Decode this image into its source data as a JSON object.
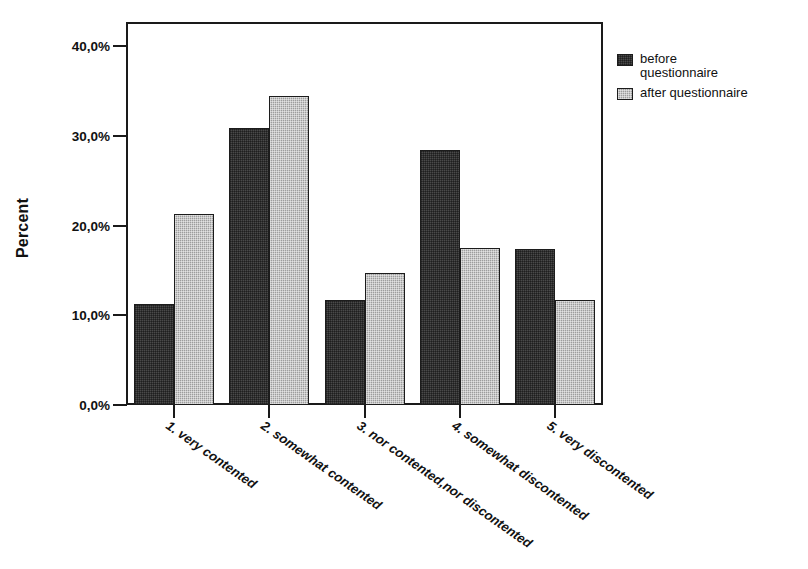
{
  "chart_data": {
    "type": "bar",
    "title": "",
    "xlabel": "",
    "ylabel": "Percent",
    "ylim": [
      0,
      40
    ],
    "ytick_values": [
      0,
      10,
      20,
      30,
      40
    ],
    "ytick_labels": [
      "0,0%",
      "10,0%",
      "20,0%",
      "30,0%",
      "40,0%"
    ],
    "grid": false,
    "legend_position": "right-top",
    "categories": [
      "1. very contented",
      "2. somewhat contented",
      "3. nor contented,nor discontented",
      "4. somewhat discontented",
      "5. very discontented"
    ],
    "series": [
      {
        "name": "before questionnaire",
        "color": "#4a4a4a",
        "values": [
          11.2,
          30.9,
          11.7,
          28.4,
          17.4
        ]
      },
      {
        "name": "after questionnaire",
        "color": "#9d9d9d",
        "values": [
          21.3,
          34.4,
          14.7,
          17.5,
          11.7
        ]
      }
    ]
  },
  "axis": {
    "y_title": "Percent",
    "y_ticks": [
      {
        "label": "40,0%",
        "value": 40
      },
      {
        "label": "30,0%",
        "value": 30
      },
      {
        "label": "20,0%",
        "value": 20
      },
      {
        "label": "10,0%",
        "value": 10
      },
      {
        "label": "0,0%",
        "value": 0
      }
    ]
  },
  "legend": {
    "items": [
      {
        "label": "before\nquestionnaire",
        "swatch": "dark"
      },
      {
        "label": "after questionnaire",
        "swatch": "light"
      }
    ]
  },
  "colors": {
    "series_before": "#4a4a4a",
    "series_after": "#9d9d9d",
    "axis": "#1a1a1a",
    "background": "#ffffff"
  }
}
